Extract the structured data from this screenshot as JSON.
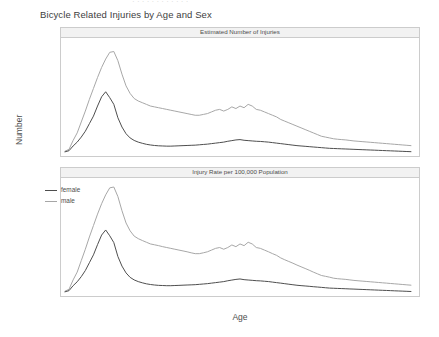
{
  "clipped_header": "· · · · · · · · · · · ·",
  "chart_title": "Bicycle Related Injuries by Age and Sex",
  "axes": {
    "xlabel": "Age",
    "ylabel": "Number"
  },
  "legend": {
    "position": "top-left-of-lower-panel",
    "items": [
      {
        "label": "female",
        "color": "#4d4d4d"
      },
      {
        "label": "male",
        "color": "#a6a6a6"
      }
    ]
  },
  "panels": [
    {
      "strip_label": "Estimated Number of Injuries"
    },
    {
      "strip_label": "Injury Rate per 100,000 Population"
    }
  ],
  "chart_data": [
    {
      "type": "line",
      "title": "Estimated Number of Injuries",
      "xlabel": "Age",
      "ylabel": "Number",
      "xlim": [
        0,
        86
      ],
      "ylim": [
        0,
        65000
      ],
      "xticks": [
        0,
        20,
        40,
        60,
        80
      ],
      "yticks": [
        0,
        20000,
        40000,
        60000
      ],
      "grid": false,
      "x": [
        0,
        1,
        2,
        3,
        4,
        5,
        6,
        7,
        8,
        9,
        10,
        11,
        12,
        13,
        14,
        15,
        16,
        17,
        18,
        19,
        20,
        21,
        22,
        23,
        24,
        25,
        26,
        27,
        28,
        29,
        30,
        31,
        32,
        33,
        34,
        35,
        36,
        37,
        38,
        39,
        40,
        41,
        42,
        43,
        44,
        45,
        46,
        47,
        48,
        49,
        50,
        51,
        52,
        53,
        54,
        55,
        56,
        57,
        58,
        59,
        60,
        61,
        62,
        63,
        64,
        65,
        66,
        67,
        68,
        69,
        70,
        71,
        72,
        73,
        74,
        75,
        76,
        77,
        78,
        79,
        80,
        81,
        82,
        83,
        84,
        85
      ],
      "series": [
        {
          "name": "female",
          "color": "#4d4d4d",
          "values": [
            700,
            1400,
            4200,
            6500,
            9500,
            13000,
            17500,
            22000,
            28000,
            33500,
            36500,
            33000,
            29000,
            21000,
            15500,
            11500,
            9000,
            7500,
            6500,
            5800,
            5200,
            4800,
            4500,
            4300,
            4200,
            4100,
            4100,
            4200,
            4300,
            4400,
            4500,
            4600,
            4700,
            4900,
            5100,
            5300,
            5600,
            5900,
            6200,
            6500,
            7000,
            7400,
            7800,
            8000,
            7600,
            7400,
            7200,
            7000,
            6900,
            6700,
            6500,
            6200,
            5900,
            5600,
            5300,
            5000,
            4700,
            4400,
            4200,
            4000,
            3800,
            3600,
            3400,
            3200,
            3000,
            2800,
            2700,
            2600,
            2500,
            2400,
            2300,
            2200,
            2100,
            2000,
            1900,
            1800,
            1700,
            1600,
            1500,
            1400,
            1300,
            1200,
            1100,
            1000,
            900,
            800
          ]
        },
        {
          "name": "male",
          "color": "#a6a6a6",
          "values": [
            1100,
            2200,
            7500,
            12000,
            18500,
            25000,
            32000,
            38500,
            45000,
            51000,
            56000,
            60000,
            60500,
            55000,
            47000,
            40000,
            35500,
            32500,
            31000,
            30000,
            29000,
            28000,
            27500,
            27000,
            26500,
            26000,
            25500,
            25000,
            24500,
            24000,
            23500,
            23000,
            22500,
            22500,
            23000,
            23500,
            24500,
            25500,
            26000,
            25000,
            26000,
            27500,
            26500,
            28000,
            27000,
            29000,
            28000,
            26000,
            25500,
            24500,
            23500,
            22500,
            21500,
            20000,
            19000,
            18000,
            17000,
            16000,
            15000,
            14000,
            13000,
            12000,
            11000,
            10000,
            9500,
            9000,
            8500,
            8200,
            8000,
            7800,
            7500,
            7200,
            7000,
            6800,
            6600,
            6400,
            6200,
            6000,
            5800,
            5600,
            5400,
            5200,
            5000,
            4800,
            4600,
            4400
          ]
        }
      ]
    },
    {
      "type": "line",
      "title": "Injury Rate per 100,000 Population",
      "xlabel": "Age",
      "ylabel": "Number",
      "xlim": [
        0,
        86
      ],
      "ylim": [
        0,
        3200
      ],
      "xticks": [
        0,
        20,
        40,
        60,
        80
      ],
      "yticks": [
        0,
        1000,
        2000,
        3000
      ],
      "grid": false,
      "x": [
        0,
        1,
        2,
        3,
        4,
        5,
        6,
        7,
        8,
        9,
        10,
        11,
        12,
        13,
        14,
        15,
        16,
        17,
        18,
        19,
        20,
        21,
        22,
        23,
        24,
        25,
        26,
        27,
        28,
        29,
        30,
        31,
        32,
        33,
        34,
        35,
        36,
        37,
        38,
        39,
        40,
        41,
        42,
        43,
        44,
        45,
        46,
        47,
        48,
        49,
        50,
        51,
        52,
        53,
        54,
        55,
        56,
        57,
        58,
        59,
        60,
        61,
        62,
        63,
        64,
        65,
        66,
        67,
        68,
        69,
        70,
        71,
        72,
        73,
        74,
        75,
        76,
        77,
        78,
        79,
        80,
        81,
        82,
        83,
        84,
        85
      ],
      "series": [
        {
          "name": "female",
          "color": "#4d4d4d",
          "values": [
            35,
            70,
            215,
            330,
            480,
            660,
            890,
            1120,
            1420,
            1700,
            1850,
            1680,
            1480,
            1070,
            790,
            590,
            460,
            385,
            335,
            300,
            270,
            250,
            235,
            225,
            220,
            215,
            215,
            220,
            225,
            230,
            235,
            240,
            245,
            255,
            265,
            275,
            290,
            305,
            320,
            335,
            360,
            380,
            400,
            412,
            392,
            382,
            372,
            362,
            356,
            346,
            336,
            320,
            305,
            290,
            274,
            258,
            243,
            228,
            217,
            207,
            197,
            186,
            176,
            166,
            155,
            145,
            140,
            135,
            130,
            125,
            120,
            115,
            110,
            105,
            100,
            95,
            90,
            85,
            80,
            75,
            70,
            65,
            60,
            55,
            50,
            45
          ]
        },
        {
          "name": "male",
          "color": "#a6a6a6",
          "values": [
            55,
            110,
            385,
            615,
            950,
            1285,
            1645,
            1980,
            2315,
            2620,
            2880,
            3085,
            3110,
            2830,
            2415,
            2055,
            1825,
            1670,
            1595,
            1540,
            1490,
            1440,
            1415,
            1390,
            1360,
            1335,
            1310,
            1285,
            1260,
            1235,
            1210,
            1180,
            1155,
            1155,
            1180,
            1210,
            1260,
            1310,
            1335,
            1285,
            1335,
            1410,
            1360,
            1440,
            1390,
            1490,
            1440,
            1335,
            1310,
            1260,
            1210,
            1155,
            1105,
            1030,
            975,
            925,
            875,
            820,
            770,
            720,
            670,
            615,
            565,
            515,
            490,
            465,
            435,
            420,
            410,
            400,
            385,
            370,
            360,
            350,
            340,
            330,
            320,
            310,
            300,
            290,
            280,
            270,
            260,
            250,
            240,
            230
          ]
        }
      ]
    }
  ]
}
